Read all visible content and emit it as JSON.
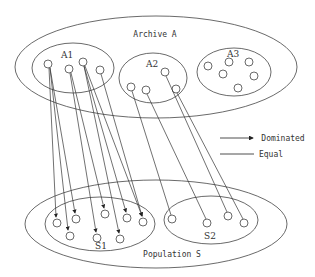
{
  "labels": {
    "archive": "Archive A",
    "a1": "A1",
    "a2": "A2",
    "a3": "A3",
    "population": "Population S",
    "s1": "S1",
    "s2": "S2"
  },
  "legend": {
    "dominated": "Dominated",
    "equal": "Equal"
  },
  "colors": {
    "stroke": "#333333",
    "background": "#ffffff"
  }
}
